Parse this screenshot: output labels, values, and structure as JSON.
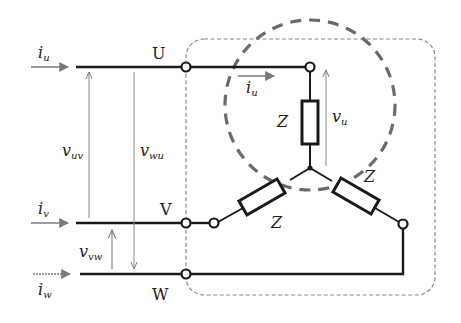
{
  "diagram": {
    "colors": {
      "wire": "#1a1a1a",
      "arrow": "#7a7a7a",
      "dashed_box": "#8a8a8a",
      "dashed_circle": "#6a6a6a",
      "background": "#ffffff"
    },
    "lines": {
      "U": {
        "label": "U",
        "y": 67
      },
      "V": {
        "label": "V",
        "y": 223
      },
      "W": {
        "label": "W",
        "y": 274
      }
    },
    "currents": {
      "iu_main": {
        "symbol": "i",
        "subscript": "u"
      },
      "iv": {
        "symbol": "i",
        "subscript": "v"
      },
      "iw": {
        "symbol": "i",
        "subscript": "w"
      },
      "iu_load": {
        "symbol": "i",
        "subscript": "u"
      }
    },
    "voltages": {
      "vuv": {
        "symbol": "v",
        "subscript": "uv"
      },
      "vwu": {
        "symbol": "v",
        "subscript": "wu"
      },
      "vvw": {
        "symbol": "v",
        "subscript": "vw"
      },
      "vu": {
        "symbol": "v",
        "subscript": "u"
      }
    },
    "impedances": [
      {
        "label": "Z",
        "branch": "U"
      },
      {
        "label": "Z",
        "branch": "V"
      },
      {
        "label": "Z",
        "branch": "W"
      }
    ],
    "neutral_node": {
      "x": 310,
      "y": 168
    }
  }
}
